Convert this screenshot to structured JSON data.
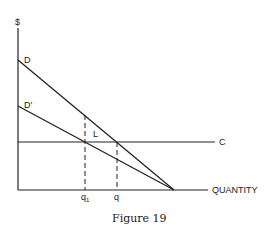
{
  "diagram": {
    "y_axis_label": "$",
    "x_axis_label": "QUANTITY",
    "curves": {
      "D": "D",
      "D_prime": "D'",
      "C": "C"
    },
    "region_label": "L",
    "x_ticks": {
      "q1": "q",
      "q1_sub": "1",
      "q": "q"
    },
    "caption": "Figure 19"
  }
}
